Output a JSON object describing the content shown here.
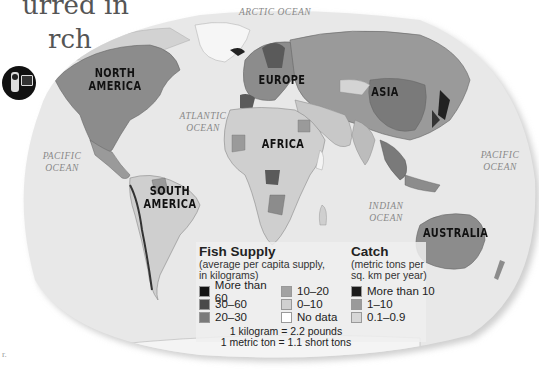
{
  "page": {
    "background_text": [
      "urred in",
      "rch"
    ],
    "stray_text": "r."
  },
  "map": {
    "title": "Fish Supply and Catch",
    "continents": [
      {
        "name": "NORTH AMERICA",
        "line1": "NORTH",
        "line2": "AMERICA"
      },
      {
        "name": "SOUTH AMERICA",
        "line1": "SOUTH",
        "line2": "AMERICA"
      },
      {
        "name": "EUROPE",
        "line1": "EUROPE",
        "line2": ""
      },
      {
        "name": "ASIA",
        "line1": "ASIA",
        "line2": ""
      },
      {
        "name": "AFRICA",
        "line1": "AFRICA",
        "line2": ""
      },
      {
        "name": "AUSTRALIA",
        "line1": "AUSTRALIA",
        "line2": ""
      }
    ],
    "oceans": [
      {
        "name": "ARCTIC OCEAN",
        "line1": "ARCTIC OCEAN",
        "line2": ""
      },
      {
        "name": "ATLANTIC OCEAN",
        "line1": "ATLANTIC",
        "line2": "OCEAN"
      },
      {
        "name": "PACIFIC OCEAN (west)",
        "line1": "PACIFIC",
        "line2": "OCEAN"
      },
      {
        "name": "PACIFIC OCEAN (east)",
        "line1": "PACIFIC",
        "line2": "OCEAN"
      },
      {
        "name": "INDIAN OCEAN",
        "line1": "INDIAN",
        "line2": "OCEAN"
      }
    ]
  },
  "legend": {
    "fish_supply": {
      "title": "Fish Supply",
      "subtitle_line1": "(average per capita supply,",
      "subtitle_line2": "in kilograms)",
      "items": [
        {
          "label": "More than 60",
          "color": "#141414"
        },
        {
          "label": "30–60",
          "color": "#4a4a4a"
        },
        {
          "label": "20–30",
          "color": "#7a7a7a"
        },
        {
          "label": "10–20",
          "color": "#a2a2a2"
        },
        {
          "label": "0–10",
          "color": "#d0d0d0"
        },
        {
          "label": "No data",
          "color": "#ffffff"
        }
      ]
    },
    "catch": {
      "title": "Catch",
      "subtitle_line1": "(metric tons per",
      "subtitle_line2": "sq. km per year)",
      "items": [
        {
          "label": "More than 10",
          "color": "#1a1a1a"
        },
        {
          "label": "1–10",
          "color": "#9a9a9a"
        },
        {
          "label": "0.1–0.9",
          "color": "#d6d6d6"
        }
      ]
    },
    "conversions": [
      "1 kilogram = 2.2 pounds",
      "1 metric ton = 1.1 short tons"
    ]
  },
  "icons": {
    "camera": "video-camera-icon"
  },
  "colors": {
    "ocean": "#e6e6e6",
    "land_light": "#cfcfcf",
    "land_mid": "#8c8c8c",
    "land_dark": "#5a5a5a"
  }
}
